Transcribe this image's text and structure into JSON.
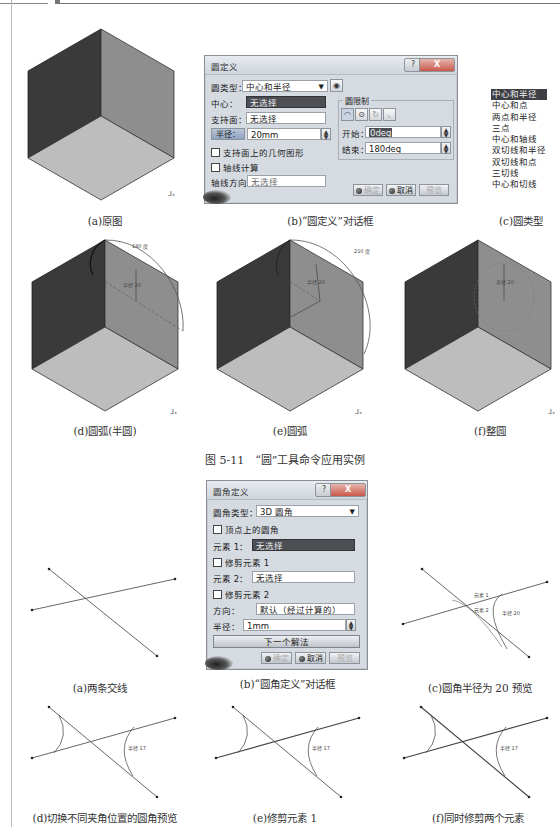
{
  "figure_5_11": {
    "title": "图 5-11　“圆”工具命令应用实例",
    "captions": {
      "a": "(a)原图",
      "b": "(b)“圆定义”对话框",
      "c": "(c)圆类型",
      "d": "(d)圆弧(半圆)",
      "e": "(e)圆弧",
      "f": "(f)整圆"
    },
    "circle_dialog": {
      "title": "圆定义",
      "help": "?",
      "close": "X",
      "type_label": "圆类型：",
      "type_value": "中心和半径",
      "center_label": "中心：",
      "center_value": "无选择",
      "support_label": "支持面：",
      "support_value": "无选择",
      "radius_button": "半径：",
      "radius_value": "20mm",
      "geometry_on_support": "支持面上的几何图形",
      "axis_computation": "轴线计算",
      "axis_direction_label": "轴线方向：",
      "axis_direction_value": "无选择",
      "limits_group": "圆限制",
      "start_label": "开始：",
      "start_value": "0deg",
      "end_label": "结束：",
      "end_value": "180deg",
      "ok": "确定",
      "cancel": "取消",
      "preview": "预览"
    },
    "circle_types": {
      "selected": "中心和半径",
      "items": [
        "中心和半径",
        "中心和点",
        "两点和半径",
        "三点",
        "中心和轴线",
        "双切线和半径",
        "双切线和点",
        "三切线",
        "中心和切线"
      ]
    },
    "annotations": {
      "d_angle": "180度",
      "e_angle": "210度",
      "radius": "半径 20",
      "start_mark": "0度"
    }
  },
  "figure_corner": {
    "captions": {
      "a": "(a)两条交线",
      "b": "(b)“圆角定义”对话框",
      "c": "(c)圆角半径为 20 预览",
      "d": "(d)切换不同夹角位置的圆角预览",
      "e": "(e)修剪元素 1",
      "f": "(f)同时修剪两个元素"
    },
    "corner_dialog": {
      "title": "圆角定义",
      "help": "?",
      "close": "X",
      "type_label": "圆角类型：",
      "type_value": "3D 圆角",
      "vertex_corner": "顶点上的圆角",
      "element1_label": "元素 1：",
      "element1_value": "无选择",
      "trim1": "修剪元素 1",
      "element2_label": "元素 2：",
      "element2_value": "无选择",
      "trim2": "修剪元素 2",
      "direction_label": "方向：",
      "direction_value": "默认（经过计算的）",
      "radius_label": "半径：",
      "radius_value": "1mm",
      "next_solution": "下一个解法",
      "ok": "确定",
      "cancel": "取消",
      "preview": "预览"
    },
    "annotations": {
      "radius_c": "半径 20",
      "radius_def": "半径 17",
      "elem1": "元素 1",
      "elem2": "元素 2"
    }
  }
}
